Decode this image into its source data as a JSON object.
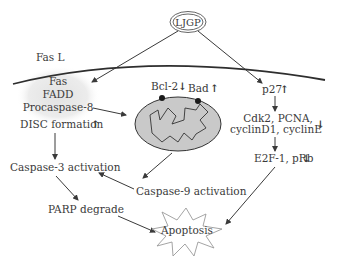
{
  "diagram": {
    "source_node": {
      "label": "LJGP"
    },
    "membrane": {
      "ligand_label": "Fas L"
    },
    "disc_complex": {
      "items": [
        "Fas",
        "FADD",
        "Procaspase-8"
      ],
      "formation_label": "DISC formation",
      "formation_direction": "up"
    },
    "mitochondrion": {
      "bcl2": {
        "label": "Bcl-2",
        "direction": "down"
      },
      "bad": {
        "label": "Bad",
        "direction": "up"
      }
    },
    "cell_cycle": {
      "p27": {
        "label": "p27",
        "direction": "up"
      },
      "cdk_line1": "Cdk2, PCNA,",
      "cdk_line2": "cyclinD1, cyclinE",
      "cdk_direction": "down",
      "e2f": {
        "label": "E2F-1, pRb",
        "direction": "down"
      }
    },
    "caspase3": {
      "label": "Caspase-3 activation"
    },
    "caspase9": {
      "label": "Caspase-9 activation"
    },
    "parp": {
      "label": "PARP degrade"
    },
    "outcome": {
      "label": "Apoptosis"
    },
    "arrows": {
      "up": "↑",
      "down": "↓"
    },
    "colors": {
      "text": "#3a3a3a",
      "mito_fill": "#c9c9c9",
      "disc_cloud": "#e6e6e6",
      "membrane": "#2e2e2e",
      "star_stroke": "#9a9a9a"
    }
  }
}
